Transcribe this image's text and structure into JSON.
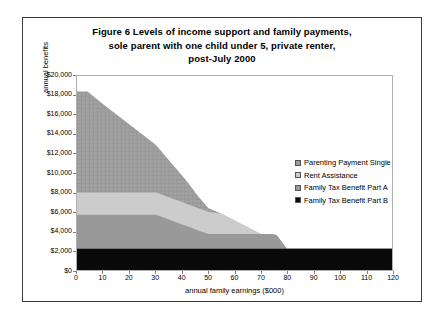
{
  "figure": {
    "title_lines": [
      "Figure 6   Levels of income support and family payments,",
      "sole parent with one child under 5, private renter,",
      "post-July 2000"
    ]
  },
  "chart_data": {
    "type": "area",
    "stacked": true,
    "title": "Figure 6   Levels of income support and family payments, sole parent with one child under 5, private renter, post-July 2000",
    "xlabel": "annual family earnings ($000)",
    "ylabel": "annual benefits",
    "xlim": [
      0,
      120
    ],
    "ylim": [
      0,
      20000
    ],
    "xticks": [
      0,
      10,
      20,
      30,
      40,
      50,
      60,
      70,
      80,
      90,
      100,
      110,
      120
    ],
    "yticks": [
      0,
      2000,
      4000,
      6000,
      8000,
      10000,
      12000,
      14000,
      16000,
      18000,
      20000
    ],
    "ytick_labels": [
      "$0",
      "$2,000",
      "$4,000",
      "$6,000",
      "$8,000",
      "$10,000",
      "$12,000",
      "$14,000",
      "$16,000",
      "$18,000",
      "$20,000"
    ],
    "xtick_labels": [
      "0",
      "10",
      "20",
      "30",
      "40",
      "50",
      "60",
      "70",
      "80",
      "90",
      "100",
      "110",
      "120"
    ],
    "grid": false,
    "legend_position": "center-right",
    "x": [
      0,
      4,
      10,
      20,
      30,
      33,
      36,
      40,
      42,
      46,
      50,
      55,
      60,
      65,
      70,
      74,
      76,
      80,
      90,
      100,
      110,
      120
    ],
    "series": [
      {
        "name": "Parenting Payment Single",
        "color": "#9a9a9a",
        "pattern": "crosshatch",
        "values": [
          10400,
          10400,
          9100,
          7000,
          4900,
          4250,
          3600,
          2750,
          2300,
          1250,
          400,
          0,
          0,
          0,
          0,
          0,
          0,
          0,
          0,
          0,
          0,
          0
        ]
      },
      {
        "name": "Rent Assistance",
        "color": "#cccccc",
        "pattern": "solid",
        "values": [
          2300,
          2300,
          2300,
          2300,
          2300,
          2300,
          2300,
          2300,
          2300,
          2300,
          2300,
          2100,
          1400,
          700,
          0,
          0,
          0,
          0,
          0,
          0,
          0,
          0
        ]
      },
      {
        "name": "Family Tax Benefit Part A",
        "color": "#999999",
        "pattern": "solid",
        "values": [
          3500,
          3500,
          3500,
          3500,
          3500,
          3200,
          2900,
          2500,
          2300,
          1900,
          1500,
          1500,
          1500,
          1500,
          1500,
          1500,
          1400,
          0,
          0,
          0,
          0,
          0
        ]
      },
      {
        "name": "Family Tax Benefit Part B",
        "color": "#0a0a0a",
        "pattern": "solid",
        "values": [
          2200,
          2200,
          2200,
          2200,
          2200,
          2200,
          2200,
          2200,
          2200,
          2200,
          2200,
          2200,
          2200,
          2200,
          2200,
          2200,
          2200,
          2200,
          2200,
          2200,
          2200,
          2200
        ]
      }
    ]
  },
  "legend": {
    "items": [
      {
        "label": "Parenting Payment Single",
        "color": "#9a9a9a"
      },
      {
        "label": "Rent Assistance",
        "color": "#cccccc"
      },
      {
        "label": "Family Tax Benefit Part A",
        "color": "#999999"
      },
      {
        "label": "Family Tax Benefit Part B",
        "color": "#0a0a0a"
      }
    ]
  }
}
